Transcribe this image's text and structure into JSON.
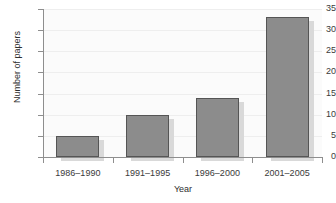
{
  "chart_data": {
    "type": "bar",
    "title": "",
    "xlabel": "Year",
    "ylabel": "Number of papers",
    "categories": [
      "1986–1990",
      "1991–1995",
      "1996–2000",
      "2001–2005"
    ],
    "values": [
      5,
      10,
      14,
      33
    ],
    "ylim": [
      0,
      35
    ],
    "yticks": [
      0,
      5,
      10,
      15,
      20,
      25,
      30,
      35
    ],
    "ytick_labels": [
      "0",
      "5",
      "10",
      "15",
      "20",
      "25",
      "30",
      "35"
    ],
    "grid": true,
    "legend": null,
    "bar_color": "#8c8c8c",
    "bar_edge_color": "#555555",
    "shadow_color": "#d9d9d9",
    "gridline_color": "#eeeeee",
    "axis_color": "#8e8e8e",
    "plot_background": "#fbfbfb"
  }
}
